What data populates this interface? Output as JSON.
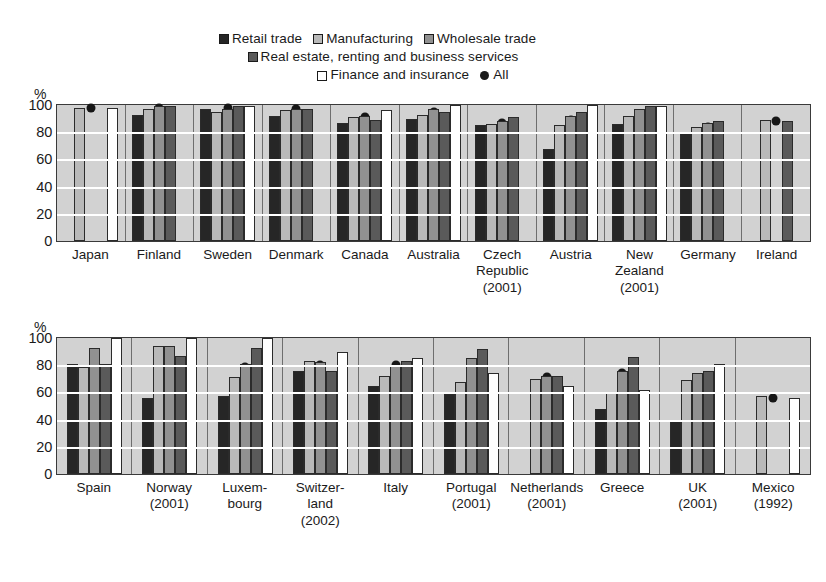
{
  "legend": {
    "row1": [
      {
        "key": "retail",
        "label": "Retail trade",
        "swatch": "retail-swatch",
        "color": "#262626"
      },
      {
        "key": "manufacturing",
        "label": "Manufacturing",
        "swatch": "manufacturing-swatch",
        "color": "#b9b9b9"
      },
      {
        "key": "wholesale",
        "label": "Wholesale trade",
        "swatch": "wholesale-swatch",
        "color": "#919191"
      },
      {
        "key": "real",
        "label": "Real estate, renting and business services",
        "swatch": "real-estate-swatch",
        "color": "#5a5a5a"
      }
    ],
    "row2": [
      {
        "key": "finance",
        "label": "Finance and insurance",
        "swatch": "finance-swatch",
        "color": "#ffffff"
      },
      {
        "key": "all",
        "label": "All",
        "swatch": "all-dot-marker",
        "color": "#161616"
      }
    ]
  },
  "chart_data": [
    {
      "id": "top-chart",
      "type": "bar",
      "title": "",
      "xlabel": "",
      "ylabel": "%",
      "ylim": [
        0,
        100
      ],
      "yticks": [
        0,
        20,
        40,
        60,
        80,
        100
      ],
      "ytick_labels": [
        "0",
        "20",
        "40",
        "60",
        "80",
        "100"
      ],
      "grid": true,
      "legend_position": "top",
      "categories": [
        "Japan",
        "Finland",
        "Sweden",
        "Denmark",
        "Canada",
        "Australia",
        "Czech Republic (2001)",
        "Austria",
        "New Zealand (2001)",
        "Germany",
        "Ireland"
      ],
      "category_lines": [
        [
          "Japan"
        ],
        [
          "Finland"
        ],
        [
          "Sweden"
        ],
        [
          "Denmark"
        ],
        [
          "Canada"
        ],
        [
          "Australia"
        ],
        [
          "Czech",
          "Republic",
          "(2001)"
        ],
        [
          "Austria"
        ],
        [
          "New",
          "Zealand",
          "(2001)"
        ],
        [
          "Germany"
        ],
        [
          "Ireland"
        ]
      ],
      "series": [
        {
          "name": "Retail trade",
          "key": "retail",
          "values": [
            null,
            93,
            97,
            92,
            87,
            90,
            85,
            68,
            86,
            80,
            null
          ]
        },
        {
          "name": "Manufacturing",
          "key": "manufacturing",
          "values": [
            98,
            97,
            95,
            96,
            91,
            93,
            86,
            85,
            92,
            84,
            89
          ]
        },
        {
          "name": "Wholesale trade",
          "key": "wholesale",
          "values": [
            null,
            99,
            97,
            97,
            92,
            97,
            88,
            92,
            97,
            87,
            null
          ]
        },
        {
          "name": "Real estate, renting and business services",
          "key": "real",
          "values": [
            null,
            99,
            99,
            97,
            89,
            95,
            91,
            95,
            99,
            88,
            88
          ]
        },
        {
          "name": "Finance and insurance",
          "key": "finance",
          "values": [
            98,
            null,
            99,
            null,
            96,
            100,
            null,
            100,
            99,
            null,
            null
          ]
        }
      ],
      "all_marker": {
        "name": "All",
        "values": [
          98,
          98,
          98,
          97,
          91,
          95,
          87,
          89,
          91,
          84,
          88
        ]
      }
    },
    {
      "id": "bottom-chart",
      "type": "bar",
      "title": "",
      "xlabel": "",
      "ylabel": "%",
      "ylim": [
        0,
        100
      ],
      "yticks": [
        0,
        20,
        40,
        60,
        80,
        100
      ],
      "ytick_labels": [
        "0",
        "20",
        "40",
        "60",
        "80",
        "100"
      ],
      "grid": true,
      "legend_position": "top",
      "categories": [
        "Spain",
        "Norway (2001)",
        "Luxembourg",
        "Switzerland (2002)",
        "Italy",
        "Portugal (2001)",
        "Netherlands (2001)",
        "Greece",
        "UK (2001)",
        "Mexico (1992)"
      ],
      "category_lines": [
        [
          "Spain"
        ],
        [
          "Norway",
          "(2001)"
        ],
        [
          "Luxem-",
          "bourg"
        ],
        [
          "Switzer-",
          "land",
          "(2002)"
        ],
        [
          "Italy"
        ],
        [
          "Portugal",
          "(2001)"
        ],
        [
          "Netherlands",
          "(2001)"
        ],
        [
          "Greece"
        ],
        [
          "UK",
          "(2001)"
        ],
        [
          "Mexico",
          "(1992)"
        ]
      ],
      "series": [
        {
          "name": "Retail trade",
          "key": "retail",
          "values": [
            81,
            56,
            57,
            76,
            65,
            59,
            null,
            48,
            40,
            null
          ]
        },
        {
          "name": "Manufacturing",
          "key": "manufacturing",
          "values": [
            79,
            94,
            71,
            83,
            72,
            68,
            70,
            60,
            69,
            57
          ]
        },
        {
          "name": "Wholesale trade",
          "key": "wholesale",
          "values": [
            93,
            94,
            81,
            82,
            80,
            85,
            72,
            76,
            74,
            null
          ]
        },
        {
          "name": "Real estate, renting and business services",
          "key": "real",
          "values": [
            81,
            87,
            93,
            76,
            83,
            92,
            72,
            86,
            76,
            null
          ]
        },
        {
          "name": "Finance and insurance",
          "key": "finance",
          "values": [
            100,
            100,
            100,
            90,
            85,
            74,
            65,
            62,
            81,
            56
          ]
        }
      ],
      "all_marker": {
        "name": "All",
        "values": [
          83,
          85,
          79,
          80,
          80,
          74,
          71,
          74,
          65,
          56
        ]
      }
    }
  ]
}
